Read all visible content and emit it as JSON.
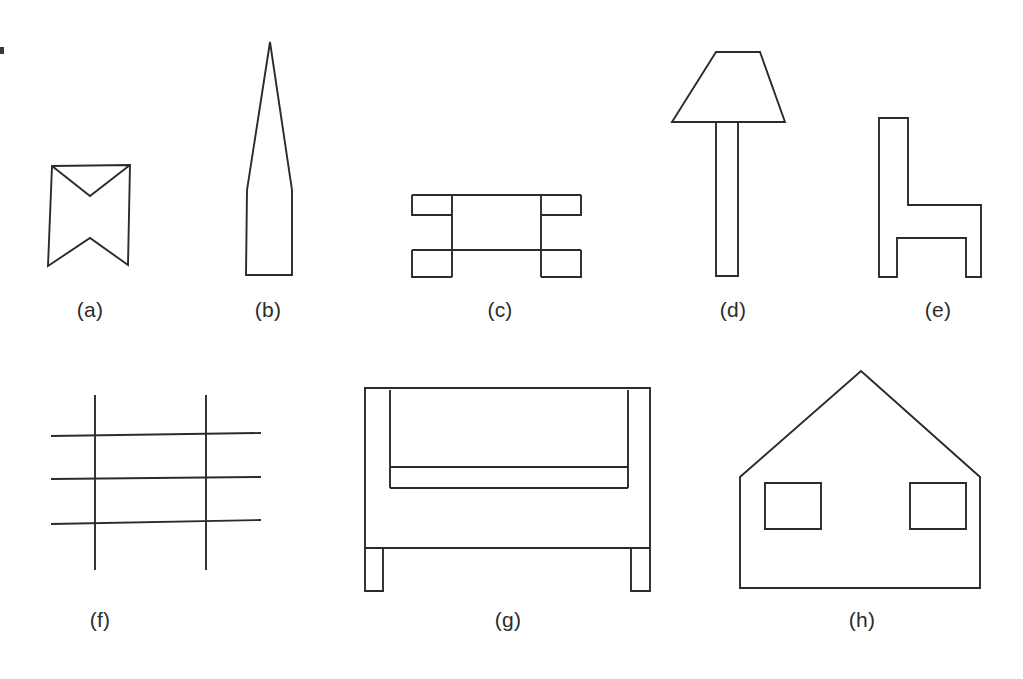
{
  "figure": {
    "background_color": "#ffffff",
    "stroke_color": "#2b2b2b",
    "caption_color": "#2b2b2b",
    "canvas": {
      "width": 1023,
      "height": 679
    },
    "rows": [
      {
        "name": "top-row",
        "items": [
          "a",
          "b",
          "c",
          "d",
          "e"
        ]
      },
      {
        "name": "bottom-row",
        "items": [
          "f",
          "g",
          "h"
        ]
      }
    ],
    "panels": [
      {
        "id": "a",
        "label": "(a)",
        "description": "bowtie / hourglass polygon with notched left and right",
        "label_x": 90,
        "label_y": 298,
        "shape_type": "polygon"
      },
      {
        "id": "b",
        "label": "(b)",
        "description": "tall narrow spike, pointed at top, flat rectangular base",
        "label_x": 268,
        "label_y": 298,
        "shape_type": "polygon"
      },
      {
        "id": "c",
        "label": "(c)",
        "description": "table seen from the side: top rail, two legs, stretcher bars",
        "label_x": 500,
        "label_y": 298,
        "shape_type": "outline"
      },
      {
        "id": "d",
        "label": "(d)",
        "description": "floor lamp: trapezoidal shade on a tall narrow post",
        "label_x": 733,
        "label_y": 298,
        "shape_type": "outline"
      },
      {
        "id": "e",
        "label": "(e)",
        "description": "chair in side view, shaped like the letter h",
        "label_x": 938,
        "label_y": 298,
        "shape_type": "polygon"
      },
      {
        "id": "f",
        "label": "(f)",
        "description": "grid of two vertical lines crossing three horizontal lines",
        "label_x": 100,
        "label_y": 608,
        "shape_type": "line-grid"
      },
      {
        "id": "g",
        "label": "(g)",
        "description": "sofa / armchair seen from the front with two legs",
        "label_x": 508,
        "label_y": 608,
        "shape_type": "outline"
      },
      {
        "id": "h",
        "label": "(h)",
        "description": "house with gabled roof and two square windows",
        "label_x": 862,
        "label_y": 608,
        "shape_type": "outline"
      }
    ]
  }
}
